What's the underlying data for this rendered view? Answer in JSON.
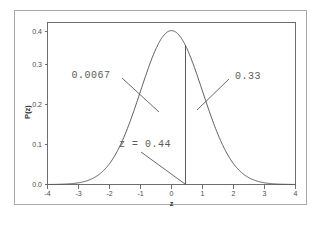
{
  "chart_data": {
    "type": "line",
    "title": "",
    "subtitle": "",
    "xlabel": "z",
    "ylabel": "P(z)",
    "xlim": [
      -4,
      4
    ],
    "ylim": [
      0.0,
      0.42
    ],
    "grid": false,
    "legend": "none",
    "distribution": "standard normal",
    "curve_formula": "P(z) = (1/sqrt(2*pi)) * exp(-z^2/2)",
    "peak_value": 0.3989,
    "peak_x": 0,
    "x_ticks": [
      "-4",
      "-3",
      "-2",
      "-1",
      "0",
      "1",
      "2",
      "3",
      "4"
    ],
    "x_tick_values": [
      -4,
      -3,
      -2,
      -1,
      0,
      1,
      2,
      3,
      4
    ],
    "y_ticks": [
      "0.0",
      "0.1",
      "0.2",
      "0.3",
      "0.4"
    ],
    "y_tick_values": [
      0.0,
      0.1,
      0.2,
      0.3,
      0.4
    ],
    "series": [
      {
        "name": "normal-density",
        "x": [
          -4.0,
          -3.75,
          -3.5,
          -3.25,
          -3.0,
          -2.75,
          -2.5,
          -2.25,
          -2.0,
          -1.75,
          -1.5,
          -1.25,
          -1.0,
          -0.75,
          -0.5,
          -0.25,
          0.0,
          0.25,
          0.5,
          0.75,
          1.0,
          1.25,
          1.5,
          1.75,
          2.0,
          2.25,
          2.5,
          2.75,
          3.0,
          3.25,
          3.5,
          3.75,
          4.0
        ],
        "values": [
          0.0001,
          0.0004,
          0.0009,
          0.002,
          0.0044,
          0.0091,
          0.0175,
          0.0317,
          0.054,
          0.0863,
          0.1295,
          0.1826,
          0.242,
          0.3011,
          0.3521,
          0.3867,
          0.3989,
          0.3867,
          0.3521,
          0.3011,
          0.242,
          0.1826,
          0.1295,
          0.0863,
          0.054,
          0.0317,
          0.0175,
          0.0091,
          0.0044,
          0.002,
          0.0009,
          0.0004,
          0.0001
        ]
      }
    ],
    "vertical_line": {
      "name": "z-cutoff-line",
      "x": 0.44,
      "y_top": 0.3606,
      "y_bottom": 0.0
    },
    "annotations": [
      {
        "name": "left-area-label",
        "text": "0.0067",
        "x_frac": 0.23,
        "y_frac": 0.33,
        "leader_to_x_frac": 0.405,
        "leader_to_y_frac": 0.54
      },
      {
        "name": "right-area-label",
        "text": "0.33",
        "x_frac": 0.79,
        "y_frac": 0.33,
        "leader_to_x_frac": 0.645,
        "leader_to_y_frac": 0.58
      },
      {
        "name": "z-value-label",
        "text": "z = 0.44",
        "x_frac": 0.43,
        "y_frac": 0.7,
        "leader_to_x_frac": 0.555,
        "leader_to_y_frac": 1.0
      }
    ]
  },
  "figure": {
    "background_color": "#ffffff",
    "frame_color": "#a8a8a8",
    "axis_color": "#6e6e6e",
    "curve_color": "#5b5b5b",
    "text_color": "#4a4a4a",
    "annotation_color": "#5a5a5a"
  },
  "labels": {
    "x_axis_title": "z",
    "y_axis_title": "P(z)",
    "x_tick_m4": "-4",
    "x_tick_m3": "-3",
    "x_tick_m2": "-2",
    "x_tick_m1": "-1",
    "x_tick_0": "0",
    "x_tick_1": "1",
    "x_tick_2": "2",
    "x_tick_3": "3",
    "x_tick_4": "4",
    "y_tick_0": "0.0",
    "y_tick_1": "0.1",
    "y_tick_2": "0.2",
    "y_tick_3": "0.3",
    "y_tick_4": "0.4",
    "annot_left": "0.0067",
    "annot_right": "0.33",
    "annot_z": "z = 0.44"
  }
}
